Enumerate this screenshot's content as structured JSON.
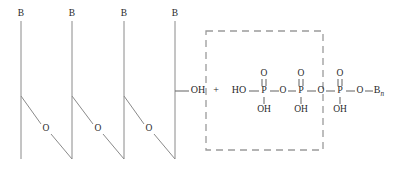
{
  "figure": {
    "width": 402,
    "height": 182,
    "background_color": "#ffffff",
    "line_color": "#8a8a8a",
    "text_color": "#2a2a2a",
    "dashed_box_color": "#9a9a9a"
  },
  "polymer": {
    "description": "Existing nucleic acid strand drawn as four vertical backbone lines capped with base labels and joined by diagonal phosphodiester links through oxygen atoms",
    "base_labels": [
      {
        "text": "B",
        "x": 21,
        "y": 14
      },
      {
        "text": "B",
        "x": 72,
        "y": 14
      },
      {
        "text": "B",
        "x": 124,
        "y": 14
      },
      {
        "text": "B",
        "x": 175,
        "y": 14
      }
    ],
    "backbone_lines": [
      {
        "x": 21,
        "y1": 21,
        "y2": 159
      },
      {
        "x": 72,
        "y1": 21,
        "y2": 159
      },
      {
        "x": 124,
        "y1": 21,
        "y2": 159
      },
      {
        "x": 175,
        "y1": 21,
        "y2": 159
      }
    ],
    "linker_oxygen_labels": [
      {
        "text": "O",
        "x": 46,
        "y": 129
      },
      {
        "text": "O",
        "x": 98,
        "y": 129
      },
      {
        "text": "O",
        "x": 149,
        "y": 129
      }
    ],
    "diagonal_segments": [
      {
        "x1": 21,
        "y1": 96,
        "x2": 41,
        "y2": 124
      },
      {
        "x1": 51,
        "y1": 134,
        "x2": 72,
        "y2": 159
      },
      {
        "x1": 72,
        "y1": 96,
        "x2": 93,
        "y2": 124
      },
      {
        "x1": 103,
        "y1": 134,
        "x2": 124,
        "y2": 159
      },
      {
        "x1": 124,
        "y1": 96,
        "x2": 144,
        "y2": 124
      },
      {
        "x1": 154,
        "y1": 134,
        "x2": 175,
        "y2": 159
      }
    ],
    "terminal_group": {
      "stub": {
        "x1": 175,
        "y1": 91,
        "x2": 189,
        "y2": 91
      },
      "label": "OH",
      "label_x": 198,
      "label_y": 91
    }
  },
  "reaction": {
    "plus_symbol": "+",
    "plus_x": 216,
    "plus_y": 91
  },
  "triphosphate": {
    "description": "Nucleoside triphosphate reactant: HO-P(=O)(OH)-O-P(=O)(OH)-O-P(=O)(OH)-O-B with subscript n",
    "chain_y": 91,
    "leading_label": {
      "text": "HO",
      "x": 239,
      "y": 91
    },
    "phosphorus_atoms": [
      {
        "label": "P",
        "x": 264,
        "y": 91,
        "double_bond_oxygen": {
          "text": "O",
          "x": 264,
          "y": 74
        },
        "hydroxyl": {
          "text": "OH",
          "x": 264,
          "y": 110
        }
      },
      {
        "label": "P",
        "x": 301,
        "y": 91,
        "double_bond_oxygen": {
          "text": "O",
          "x": 301,
          "y": 74
        },
        "hydroxyl": {
          "text": "OH",
          "x": 301,
          "y": 110
        }
      },
      {
        "label": "P",
        "x": 340,
        "y": 91,
        "double_bond_oxygen": {
          "text": "O",
          "x": 340,
          "y": 74
        },
        "hydroxyl": {
          "text": "OH",
          "x": 340,
          "y": 110
        }
      }
    ],
    "bridging_oxygens": [
      {
        "text": "O",
        "x": 283,
        "y": 91
      },
      {
        "text": "O",
        "x": 321,
        "y": 91
      },
      {
        "text": "O",
        "x": 360,
        "y": 91
      }
    ],
    "terminal_base": {
      "text": "B",
      "subscript": "n",
      "x": 379,
      "y": 91
    }
  },
  "dashed_box": {
    "label": "leaving-group region",
    "x": 206,
    "y": 31,
    "width": 117,
    "height": 119
  }
}
